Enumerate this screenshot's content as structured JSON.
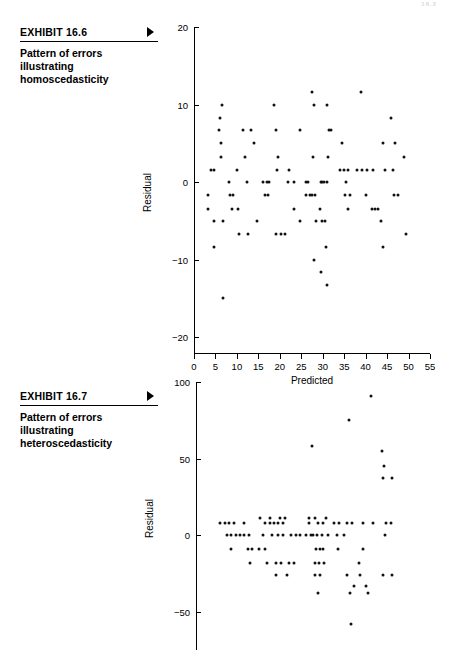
{
  "page": {
    "header_artifact": "16.2"
  },
  "exhibits": [
    {
      "id": "16.6",
      "number_label": "EXHIBIT 16.6",
      "arrow_icon": "triangle-right-icon",
      "description": "Pattern of errors illustrating homoscedasticity"
    },
    {
      "id": "16.7",
      "number_label": "EXHIBIT 16.7",
      "arrow_icon": "triangle-right-icon",
      "description": "Pattern of errors illustrating heteroscedasticity"
    }
  ],
  "chart_data": [
    {
      "id": "chart-homoscedasticity",
      "type": "scatter",
      "title": "Pattern of errors illustrating homoscedasticity",
      "xlabel": "Predicted",
      "ylabel": "Residual",
      "xlim": [
        0,
        55
      ],
      "ylim": [
        -22,
        20
      ],
      "xticks": [
        0,
        5,
        10,
        15,
        20,
        25,
        30,
        35,
        40,
        45,
        50,
        55
      ],
      "yticks": [
        20,
        10,
        0,
        -10,
        -20
      ],
      "grid": false,
      "legend": false,
      "points": [
        [
          3.2,
          -1.7
        ],
        [
          3.2,
          -3.4
        ],
        [
          4.0,
          1.6
        ],
        [
          4.6,
          1.6
        ],
        [
          4.6,
          -5.0
        ],
        [
          4.6,
          -8.4
        ],
        [
          6.5,
          10.0
        ],
        [
          6.0,
          8.3
        ],
        [
          5.9,
          6.7
        ],
        [
          6.3,
          5.0
        ],
        [
          6.4,
          3.3
        ],
        [
          6.7,
          -5.0
        ],
        [
          6.8,
          -14.9
        ],
        [
          8.2,
          0.0
        ],
        [
          8.3,
          -1.7
        ],
        [
          9.0,
          -1.7
        ],
        [
          8.9,
          -3.4
        ],
        [
          10.0,
          1.6
        ],
        [
          10.2,
          -3.4
        ],
        [
          10.4,
          -6.7
        ],
        [
          11.5,
          6.7
        ],
        [
          11.8,
          3.3
        ],
        [
          12.3,
          0.0
        ],
        [
          12.6,
          -6.7
        ],
        [
          13.3,
          6.7
        ],
        [
          14.0,
          5.0
        ],
        [
          14.6,
          -5.0
        ],
        [
          16.0,
          0.0
        ],
        [
          16.9,
          0.0
        ],
        [
          17.4,
          0.0
        ],
        [
          16.5,
          -1.7
        ],
        [
          17.2,
          -1.7
        ],
        [
          18.6,
          10.0
        ],
        [
          19.2,
          6.7
        ],
        [
          19.6,
          3.3
        ],
        [
          19.3,
          1.6
        ],
        [
          19.0,
          -6.7
        ],
        [
          20.3,
          -6.7
        ],
        [
          21.2,
          -6.7
        ],
        [
          22.2,
          1.6
        ],
        [
          22.0,
          0.0
        ],
        [
          23.4,
          0.0
        ],
        [
          23.2,
          -3.4
        ],
        [
          24.6,
          6.7
        ],
        [
          24.8,
          -5.0
        ],
        [
          26.0,
          0.0
        ],
        [
          26.6,
          0.0
        ],
        [
          26.2,
          -1.7
        ],
        [
          27.0,
          -1.7
        ],
        [
          27.4,
          11.6
        ],
        [
          28.0,
          10.0
        ],
        [
          27.8,
          3.3
        ],
        [
          27.6,
          -1.7
        ],
        [
          28.2,
          -1.7
        ],
        [
          28.5,
          -5.0
        ],
        [
          28.0,
          -10.0
        ],
        [
          29.6,
          0.0
        ],
        [
          29.8,
          0.0
        ],
        [
          30.2,
          0.0
        ],
        [
          29.4,
          -3.4
        ],
        [
          29.8,
          -5.0
        ],
        [
          30.6,
          -5.0
        ],
        [
          29.6,
          -11.5
        ],
        [
          31.0,
          10.0
        ],
        [
          31.4,
          6.7
        ],
        [
          31.9,
          6.7
        ],
        [
          31.2,
          3.3
        ],
        [
          31.0,
          0.0
        ],
        [
          30.8,
          -8.4
        ],
        [
          31.0,
          -13.3
        ],
        [
          34.0,
          1.6
        ],
        [
          35.0,
          1.6
        ],
        [
          36.0,
          1.6
        ],
        [
          34.6,
          5.0
        ],
        [
          35.4,
          0.0
        ],
        [
          35.2,
          -1.7
        ],
        [
          36.4,
          -1.7
        ],
        [
          36.0,
          -3.4
        ],
        [
          38.0,
          1.6
        ],
        [
          39.2,
          1.6
        ],
        [
          38.9,
          11.6
        ],
        [
          40.4,
          1.6
        ],
        [
          41.6,
          1.6
        ],
        [
          40.2,
          -1.7
        ],
        [
          41.4,
          -3.4
        ],
        [
          42.2,
          -3.4
        ],
        [
          42.8,
          -3.4
        ],
        [
          44.0,
          5.0
        ],
        [
          44.4,
          1.6
        ],
        [
          43.6,
          -5.0
        ],
        [
          44.0,
          -8.4
        ],
        [
          46.0,
          8.3
        ],
        [
          46.8,
          5.0
        ],
        [
          46.4,
          1.6
        ],
        [
          46.6,
          -1.7
        ],
        [
          47.6,
          -1.7
        ],
        [
          49.0,
          3.3
        ],
        [
          49.4,
          -6.7
        ]
      ]
    },
    {
      "id": "chart-heteroscedasticity",
      "type": "scatter",
      "title": "Pattern of errors illustrating heteroscedasticity",
      "xlabel": "",
      "ylabel": "Residual",
      "xlim": [
        0,
        55
      ],
      "ylim": [
        -75,
        100
      ],
      "xticks": [],
      "yticks": [
        100,
        50,
        0,
        -50
      ],
      "grid": false,
      "legend": false,
      "points": [
        [
          5.5,
          8.0
        ],
        [
          6.6,
          8.0
        ],
        [
          7.7,
          8.0
        ],
        [
          8.8,
          8.0
        ],
        [
          11.0,
          8.0
        ],
        [
          7.2,
          0.0
        ],
        [
          8.2,
          0.0
        ],
        [
          9.2,
          0.0
        ],
        [
          10.2,
          0.0
        ],
        [
          11.2,
          0.0
        ],
        [
          12.2,
          0.0
        ],
        [
          8.0,
          -9.0
        ],
        [
          12.0,
          -9.0
        ],
        [
          12.9,
          -9.0
        ],
        [
          14.5,
          -9.0
        ],
        [
          16.0,
          -9.0
        ],
        [
          12.4,
          -18.0
        ],
        [
          14.8,
          11.0
        ],
        [
          17.0,
          11.0
        ],
        [
          19.5,
          11.0
        ],
        [
          20.5,
          11.0
        ],
        [
          16.0,
          8.0
        ],
        [
          17.0,
          8.0
        ],
        [
          18.0,
          8.0
        ],
        [
          19.0,
          8.0
        ],
        [
          20.0,
          8.0
        ],
        [
          15.4,
          0.0
        ],
        [
          17.5,
          0.0
        ],
        [
          19.0,
          0.0
        ],
        [
          20.0,
          0.0
        ],
        [
          16.5,
          -18.0
        ],
        [
          18.6,
          -18.0
        ],
        [
          19.6,
          -18.0
        ],
        [
          18.4,
          -26.0
        ],
        [
          21.0,
          -26.0
        ],
        [
          22.0,
          0.0
        ],
        [
          23.0,
          0.0
        ],
        [
          24.0,
          0.0
        ],
        [
          25.5,
          0.0
        ],
        [
          26.5,
          0.0
        ],
        [
          21.6,
          -18.0
        ],
        [
          22.6,
          -18.0
        ],
        [
          26.0,
          11.0
        ],
        [
          27.6,
          11.0
        ],
        [
          30.0,
          11.0
        ],
        [
          26.2,
          8.0
        ],
        [
          28.2,
          8.0
        ],
        [
          29.4,
          8.0
        ],
        [
          27.0,
          0.0
        ],
        [
          28.0,
          0.0
        ],
        [
          29.2,
          0.0
        ],
        [
          30.4,
          0.0
        ],
        [
          27.8,
          -9.0
        ],
        [
          28.6,
          -9.0
        ],
        [
          29.4,
          -9.0
        ],
        [
          27.4,
          -18.0
        ],
        [
          28.5,
          -18.0
        ],
        [
          29.6,
          -18.0
        ],
        [
          27.6,
          -26.0
        ],
        [
          28.6,
          -26.0
        ],
        [
          26.8,
          58.0
        ],
        [
          28.2,
          -38.0
        ],
        [
          32.0,
          8.0
        ],
        [
          33.0,
          8.0
        ],
        [
          34.8,
          8.0
        ],
        [
          36.0,
          8.0
        ],
        [
          32.6,
          0.0
        ],
        [
          34.2,
          0.0
        ],
        [
          32.8,
          -9.0
        ],
        [
          35.0,
          -26.0
        ],
        [
          36.4,
          -33.0
        ],
        [
          35.6,
          -38.0
        ],
        [
          35.4,
          75.0
        ],
        [
          35.8,
          -58.0
        ],
        [
          38.5,
          8.0
        ],
        [
          41.0,
          8.0
        ],
        [
          38.6,
          -9.0
        ],
        [
          37.6,
          -18.0
        ],
        [
          37.8,
          -26.0
        ],
        [
          39.4,
          -33.0
        ],
        [
          39.8,
          -38.0
        ],
        [
          40.4,
          91.0
        ],
        [
          43.0,
          55.0
        ],
        [
          43.4,
          45.0
        ],
        [
          43.2,
          37.0
        ],
        [
          45.4,
          37.0
        ],
        [
          43.8,
          8.0
        ],
        [
          45.0,
          8.0
        ],
        [
          43.6,
          0.0
        ],
        [
          43.2,
          -26.0
        ],
        [
          45.4,
          -26.0
        ]
      ]
    }
  ]
}
